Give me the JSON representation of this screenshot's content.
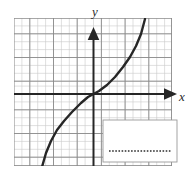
{
  "figure": {
    "kind": "coordinate-grid-graph",
    "background_color": "#ffffff",
    "grid": {
      "minor_color": "#c9c9c9",
      "major_color": "#7a7a7a",
      "minor_step_px": 7.9,
      "major_every": 5,
      "bounds_px": {
        "left": 14,
        "top": 18,
        "right": 172,
        "bottom": 166
      },
      "x_cells": 20,
      "y_cells": 19
    },
    "axes": {
      "color": "#262626",
      "origin_px": {
        "x": 93.5,
        "y": 94
      },
      "x_label": "x",
      "y_label": "y",
      "x_arrow_tip_px": {
        "x": 177,
        "y": 94
      },
      "y_arrow_tip_px": {
        "x": 93.5,
        "y": 28
      },
      "x_label_pos_px": {
        "x": 182,
        "y": 99
      },
      "y_label_pos_px": {
        "x": 96,
        "y": 15
      }
    },
    "curve": {
      "shape": "cubic",
      "description": "increasing cubic through the origin",
      "color": "#262626",
      "stroke_width": 2.4,
      "points_px": [
        [
          42,
          167
        ],
        [
          46,
          153
        ],
        [
          51,
          141
        ],
        [
          57,
          130
        ],
        [
          64,
          121
        ],
        [
          72,
          112
        ],
        [
          81,
          103
        ],
        [
          88,
          97
        ],
        [
          93.5,
          94
        ],
        [
          99,
          91
        ],
        [
          107,
          85
        ],
        [
          115,
          77
        ],
        [
          123,
          67
        ],
        [
          130,
          57
        ],
        [
          136,
          46
        ],
        [
          141,
          34
        ],
        [
          145,
          19
        ]
      ]
    },
    "answer_box": {
      "border_color": "#9a9a9a",
      "fill_color": "#ffffff",
      "rect_px": {
        "x": 103,
        "y": 120,
        "width": 74,
        "height": 42
      },
      "dotted_line": {
        "color": "#3a3a3a",
        "dot_size_px": 1.6,
        "dot_gap_px": 3.3,
        "start_px": {
          "x": 109,
          "y": 151
        },
        "end_px": {
          "x": 172,
          "y": 151
        },
        "dot_count": 20
      }
    }
  }
}
